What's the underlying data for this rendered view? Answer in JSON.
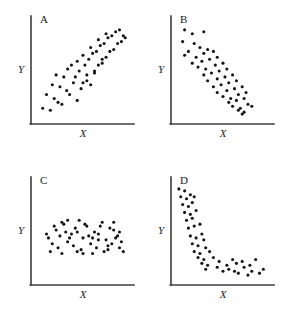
{
  "figure": {
    "background_color": "#ffffff",
    "axis_color": "#3c3c3c",
    "dot_color": "#141414",
    "dot_radius": 1.55
  },
  "chart_data": [
    {
      "type": "scatter",
      "title": "A",
      "xlabel": "X",
      "ylabel": "Y",
      "grid": false,
      "legend": null,
      "relationship": "strong positive linear association",
      "xlim": [
        0,
        100
      ],
      "ylim": [
        0,
        100
      ],
      "x": [
        8,
        16,
        24,
        12,
        20,
        28,
        33,
        18,
        26,
        36,
        44,
        30,
        40,
        48,
        22,
        34,
        42,
        50,
        38,
        46,
        54,
        58,
        44,
        52,
        62,
        56,
        66,
        50,
        60,
        70,
        64,
        74,
        58,
        68,
        78,
        72,
        82,
        66,
        76,
        86,
        80,
        90,
        74,
        84,
        92,
        88,
        94,
        70,
        62,
        54
      ],
      "y": [
        12,
        10,
        18,
        26,
        22,
        16,
        30,
        36,
        34,
        26,
        20,
        44,
        38,
        32,
        46,
        52,
        44,
        38,
        56,
        50,
        46,
        36,
        60,
        56,
        50,
        62,
        56,
        66,
        68,
        62,
        70,
        64,
        74,
        76,
        70,
        78,
        72,
        82,
        84,
        78,
        86,
        80,
        88,
        90,
        86,
        92,
        84,
        58,
        48,
        40
      ]
    },
    {
      "type": "scatter",
      "title": "B",
      "xlabel": "X",
      "ylabel": "Y",
      "grid": false,
      "legend": null,
      "relationship": "strong negative linear association",
      "xlim": [
        0,
        100
      ],
      "ylim": [
        0,
        100
      ],
      "x": [
        10,
        18,
        30,
        8,
        20,
        14,
        26,
        34,
        10,
        22,
        30,
        40,
        18,
        28,
        36,
        44,
        24,
        32,
        42,
        50,
        30,
        38,
        46,
        54,
        34,
        44,
        52,
        60,
        40,
        48,
        56,
        64,
        44,
        54,
        62,
        70,
        50,
        58,
        66,
        74,
        56,
        64,
        72,
        60,
        68,
        76,
        66,
        72,
        80,
        70
      ],
      "y": [
        92,
        88,
        90,
        80,
        78,
        70,
        74,
        72,
        66,
        64,
        68,
        70,
        58,
        60,
        62,
        64,
        54,
        52,
        56,
        58,
        46,
        48,
        50,
        52,
        40,
        42,
        44,
        46,
        34,
        36,
        38,
        40,
        28,
        30,
        32,
        34,
        24,
        22,
        26,
        28,
        18,
        20,
        22,
        14,
        12,
        16,
        10,
        8,
        14,
        6
      ]
    },
    {
      "type": "scatter",
      "title": "C",
      "xlabel": "X",
      "ylabel": "Y",
      "grid": false,
      "legend": null,
      "relationship": "no association (random cloud)",
      "xlim": [
        0,
        100
      ],
      "ylim": [
        0,
        100
      ],
      "x": [
        14,
        22,
        30,
        38,
        46,
        54,
        62,
        70,
        78,
        86,
        18,
        26,
        34,
        42,
        50,
        58,
        66,
        74,
        82,
        90,
        16,
        24,
        32,
        40,
        48,
        56,
        64,
        72,
        80,
        88,
        20,
        28,
        36,
        44,
        52,
        60,
        68,
        76,
        84,
        92,
        12,
        34,
        50,
        66,
        82,
        28,
        44,
        60,
        76,
        88
      ],
      "y": [
        44,
        52,
        58,
        48,
        62,
        56,
        50,
        60,
        54,
        46,
        38,
        46,
        40,
        54,
        44,
        38,
        48,
        42,
        52,
        40,
        30,
        34,
        50,
        36,
        32,
        46,
        34,
        30,
        38,
        34,
        56,
        28,
        44,
        30,
        58,
        28,
        56,
        32,
        44,
        30,
        48,
        62,
        28,
        42,
        60,
        60,
        50,
        44,
        36,
        50
      ]
    },
    {
      "type": "scatter",
      "title": "D",
      "xlabel": "X",
      "ylabel": "Y",
      "grid": false,
      "legend": null,
      "relationship": "strong negative curvilinear association",
      "xlim": [
        0,
        100
      ],
      "ylim": [
        0,
        100
      ],
      "x": [
        4,
        10,
        16,
        6,
        12,
        20,
        8,
        14,
        18,
        10,
        16,
        22,
        12,
        18,
        14,
        20,
        26,
        16,
        22,
        28,
        18,
        24,
        30,
        20,
        26,
        32,
        24,
        30,
        36,
        28,
        34,
        40,
        32,
        44,
        50,
        46,
        54,
        60,
        56,
        64,
        70,
        62,
        72,
        78,
        66,
        76,
        84,
        80,
        88,
        92
      ],
      "y": [
        94,
        92,
        88,
        86,
        84,
        86,
        78,
        76,
        80,
        70,
        68,
        72,
        62,
        64,
        54,
        56,
        58,
        46,
        44,
        48,
        38,
        36,
        42,
        30,
        28,
        34,
        24,
        22,
        30,
        18,
        16,
        24,
        12,
        14,
        10,
        20,
        16,
        22,
        12,
        18,
        20,
        10,
        14,
        16,
        8,
        6,
        22,
        10,
        8,
        12
      ]
    }
  ],
  "panels": [
    {
      "id": "panel-a",
      "letter": "A",
      "xlabel": "X",
      "ylabel": "Y",
      "points": [
        [
          8,
          12
        ],
        [
          16,
          10
        ],
        [
          24,
          18
        ],
        [
          12,
          26
        ],
        [
          20,
          22
        ],
        [
          28,
          16
        ],
        [
          33,
          30
        ],
        [
          18,
          36
        ],
        [
          26,
          34
        ],
        [
          36,
          26
        ],
        [
          44,
          20
        ],
        [
          30,
          44
        ],
        [
          40,
          38
        ],
        [
          48,
          32
        ],
        [
          22,
          46
        ],
        [
          34,
          52
        ],
        [
          42,
          44
        ],
        [
          50,
          38
        ],
        [
          38,
          56
        ],
        [
          46,
          50
        ],
        [
          54,
          46
        ],
        [
          58,
          36
        ],
        [
          44,
          60
        ],
        [
          52,
          56
        ],
        [
          62,
          50
        ],
        [
          56,
          62
        ],
        [
          66,
          56
        ],
        [
          50,
          66
        ],
        [
          60,
          68
        ],
        [
          70,
          62
        ],
        [
          64,
          70
        ],
        [
          74,
          64
        ],
        [
          58,
          74
        ],
        [
          68,
          76
        ],
        [
          78,
          70
        ],
        [
          72,
          78
        ],
        [
          82,
          72
        ],
        [
          66,
          82
        ],
        [
          76,
          84
        ],
        [
          86,
          78
        ],
        [
          80,
          86
        ],
        [
          90,
          80
        ],
        [
          74,
          88
        ],
        [
          84,
          90
        ],
        [
          92,
          86
        ],
        [
          88,
          92
        ],
        [
          94,
          84
        ],
        [
          70,
          58
        ],
        [
          62,
          48
        ],
        [
          54,
          40
        ]
      ]
    },
    {
      "id": "panel-b",
      "letter": "B",
      "xlabel": "X",
      "ylabel": "Y",
      "points": [
        [
          10,
          92
        ],
        [
          18,
          88
        ],
        [
          30,
          90
        ],
        [
          8,
          80
        ],
        [
          20,
          78
        ],
        [
          14,
          70
        ],
        [
          26,
          74
        ],
        [
          34,
          72
        ],
        [
          10,
          66
        ],
        [
          22,
          64
        ],
        [
          30,
          68
        ],
        [
          40,
          70
        ],
        [
          18,
          58
        ],
        [
          28,
          60
        ],
        [
          36,
          62
        ],
        [
          44,
          64
        ],
        [
          24,
          54
        ],
        [
          32,
          52
        ],
        [
          42,
          56
        ],
        [
          50,
          58
        ],
        [
          30,
          46
        ],
        [
          38,
          48
        ],
        [
          46,
          50
        ],
        [
          54,
          52
        ],
        [
          34,
          40
        ],
        [
          44,
          42
        ],
        [
          52,
          44
        ],
        [
          60,
          46
        ],
        [
          40,
          34
        ],
        [
          48,
          36
        ],
        [
          56,
          38
        ],
        [
          64,
          40
        ],
        [
          44,
          28
        ],
        [
          54,
          30
        ],
        [
          62,
          32
        ],
        [
          70,
          34
        ],
        [
          50,
          24
        ],
        [
          58,
          22
        ],
        [
          66,
          26
        ],
        [
          74,
          28
        ],
        [
          56,
          18
        ],
        [
          64,
          20
        ],
        [
          72,
          22
        ],
        [
          60,
          14
        ],
        [
          68,
          12
        ],
        [
          76,
          16
        ],
        [
          66,
          10
        ],
        [
          72,
          8
        ],
        [
          80,
          14
        ],
        [
          70,
          6
        ]
      ]
    },
    {
      "id": "panel-c",
      "letter": "C",
      "xlabel": "X",
      "ylabel": "Y",
      "points": [
        [
          14,
          44
        ],
        [
          22,
          52
        ],
        [
          30,
          58
        ],
        [
          38,
          48
        ],
        [
          46,
          62
        ],
        [
          54,
          56
        ],
        [
          62,
          50
        ],
        [
          70,
          60
        ],
        [
          78,
          54
        ],
        [
          86,
          46
        ],
        [
          18,
          38
        ],
        [
          26,
          46
        ],
        [
          34,
          40
        ],
        [
          42,
          54
        ],
        [
          50,
          44
        ],
        [
          58,
          38
        ],
        [
          66,
          48
        ],
        [
          74,
          42
        ],
        [
          82,
          52
        ],
        [
          90,
          40
        ],
        [
          16,
          30
        ],
        [
          24,
          34
        ],
        [
          32,
          50
        ],
        [
          40,
          36
        ],
        [
          48,
          32
        ],
        [
          56,
          46
        ],
        [
          64,
          34
        ],
        [
          72,
          30
        ],
        [
          80,
          38
        ],
        [
          88,
          34
        ],
        [
          20,
          56
        ],
        [
          28,
          28
        ],
        [
          36,
          44
        ],
        [
          44,
          30
        ],
        [
          52,
          58
        ],
        [
          60,
          28
        ],
        [
          68,
          56
        ],
        [
          76,
          32
        ],
        [
          84,
          44
        ],
        [
          92,
          30
        ],
        [
          12,
          48
        ],
        [
          34,
          62
        ],
        [
          50,
          28
        ],
        [
          66,
          42
        ],
        [
          82,
          60
        ],
        [
          28,
          60
        ],
        [
          44,
          50
        ],
        [
          60,
          44
        ],
        [
          76,
          36
        ],
        [
          88,
          50
        ]
      ]
    },
    {
      "id": "panel-d",
      "letter": "D",
      "xlabel": "X",
      "ylabel": "Y",
      "points": [
        [
          4,
          94
        ],
        [
          10,
          92
        ],
        [
          16,
          88
        ],
        [
          6,
          86
        ],
        [
          12,
          84
        ],
        [
          20,
          86
        ],
        [
          8,
          78
        ],
        [
          14,
          76
        ],
        [
          18,
          80
        ],
        [
          10,
          70
        ],
        [
          16,
          68
        ],
        [
          22,
          72
        ],
        [
          12,
          62
        ],
        [
          18,
          64
        ],
        [
          14,
          54
        ],
        [
          20,
          56
        ],
        [
          26,
          58
        ],
        [
          16,
          46
        ],
        [
          22,
          44
        ],
        [
          28,
          48
        ],
        [
          18,
          38
        ],
        [
          24,
          36
        ],
        [
          30,
          42
        ],
        [
          20,
          30
        ],
        [
          26,
          28
        ],
        [
          32,
          34
        ],
        [
          24,
          24
        ],
        [
          30,
          22
        ],
        [
          36,
          30
        ],
        [
          28,
          18
        ],
        [
          34,
          16
        ],
        [
          40,
          24
        ],
        [
          32,
          12
        ],
        [
          44,
          14
        ],
        [
          50,
          10
        ],
        [
          46,
          20
        ],
        [
          54,
          16
        ],
        [
          60,
          22
        ],
        [
          56,
          12
        ],
        [
          64,
          18
        ],
        [
          70,
          20
        ],
        [
          62,
          10
        ],
        [
          72,
          14
        ],
        [
          78,
          16
        ],
        [
          66,
          8
        ],
        [
          76,
          6
        ],
        [
          84,
          22
        ],
        [
          80,
          10
        ],
        [
          88,
          8
        ],
        [
          92,
          12
        ]
      ]
    }
  ]
}
